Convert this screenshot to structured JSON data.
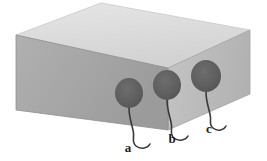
{
  "figure": {
    "title": "Rectangular block with three attached markers",
    "alt": "Isometric grey rectangular block with three dark oval markers on the front face, each with a curved tail wire labelled a, b and c",
    "canvas": {
      "width": 267,
      "height": 161,
      "background": "#ffffff"
    },
    "block": {
      "name": "rectangular-block",
      "shape": "isometric-cuboid",
      "faces": {
        "top": {
          "label": "top-face",
          "color": "#dcdcdc",
          "points": "16,35 101,3 250,30 168,68"
        },
        "front": {
          "label": "front-face",
          "color": "#a8a8a8",
          "points": "16,35 168,68 168,130 16,110"
        },
        "right": {
          "label": "right-face",
          "color": "#bdbdbd",
          "points": "168,68 250,30 250,94 168,130"
        }
      },
      "edge_color": "#8c8c8c"
    },
    "markers": [
      {
        "id": "marker-a",
        "label": "a",
        "blob": {
          "cx": 129,
          "cy": 93,
          "rx": 14,
          "ry": 15,
          "color": "#5e5e5e"
        },
        "tail_path": "M129,108 C129,116 131,122 133,130 C135,138 131,142 136,146 C141,150 148,148 150,144",
        "label_pos": {
          "x": 128,
          "y": 152
        }
      },
      {
        "id": "marker-b",
        "label": "b",
        "blob": {
          "cx": 167,
          "cy": 85,
          "rx": 14,
          "ry": 15,
          "color": "#5e5e5e"
        },
        "tail_path": "M167,100 C167,108 169,114 171,122 C173,130 169,134 174,138 C179,142 186,140 188,136",
        "label_pos": {
          "x": 172,
          "y": 143
        }
      },
      {
        "id": "marker-c",
        "label": "c",
        "blob": {
          "cx": 206,
          "cy": 76,
          "rx": 15,
          "ry": 16,
          "color": "#5e5e5e"
        },
        "tail_path": "M206,92 C206,100 208,106 210,114 C212,122 208,124 213,128 C218,132 224,130 226,126",
        "label_pos": {
          "x": 209,
          "y": 133
        }
      }
    ],
    "stroke": {
      "tail_color": "#3a3a3a",
      "tail_width": 1.6
    }
  }
}
